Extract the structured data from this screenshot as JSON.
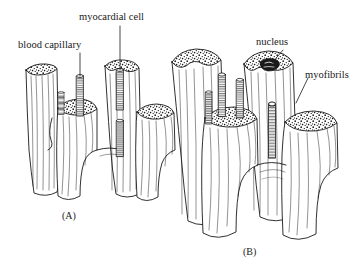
{
  "figure": {
    "style": "black-and-white line drawing, stippled cut surfaces",
    "background_color": "#ffffff",
    "ink_color": "#1a1a1a",
    "width": 360,
    "height": 271
  },
  "labels": {
    "myocardial_cell": "myocardial cell",
    "blood_capillary": "blood capillary",
    "nucleus": "nucleus",
    "myofibrils": "myofibrils"
  },
  "panels": [
    {
      "id": "A",
      "caption": "(A)",
      "description": "Cluster of cut myocardial cell segments with slender blood capillaries running between them; branching cell at lower centre.",
      "labels_shown": [
        "myocardial cell",
        "blood capillary"
      ],
      "cell_count": 5,
      "capillary_count": 4
    },
    {
      "id": "B",
      "caption": "(B)",
      "description": "Larger cluster of cut myocardial cells showing stippled cut faces, an oval nucleus in the upper-right cell, longitudinal myofibril striations, and capillaries between cells.",
      "labels_shown": [
        "nucleus",
        "myofibrils"
      ],
      "cell_count": 5,
      "capillary_count": 4
    }
  ],
  "leader_lines": [
    {
      "label": "myocardial cell",
      "from": [
        120,
        26
      ],
      "to": [
        120,
        70
      ],
      "kind": "vertical"
    },
    {
      "label": "blood capillary",
      "from": [
        80,
        53
      ],
      "to": [
        80,
        76
      ],
      "kind": "vertical"
    },
    {
      "label": "nucleus",
      "from": [
        283,
        50
      ],
      "to": [
        272,
        76
      ],
      "kind": "diagonal"
    },
    {
      "label": "myofibrils",
      "from": [
        308,
        78
      ],
      "to": [
        296,
        100
      ],
      "kind": "diagonal"
    }
  ]
}
